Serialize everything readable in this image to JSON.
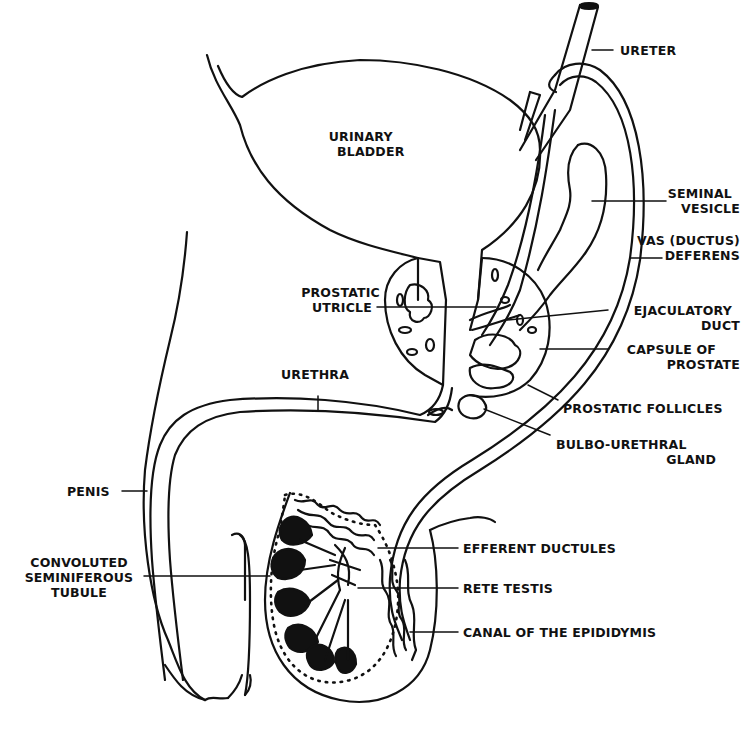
{
  "diagram": {
    "colors": {
      "ink": "#111111",
      "background": "#ffffff"
    },
    "labels": [
      {
        "id": "ureter",
        "lines": [
          "URETER"
        ]
      },
      {
        "id": "urinary-bladder",
        "lines": [
          "URINARY",
          "BLADDER"
        ]
      },
      {
        "id": "seminal-vesicle",
        "lines": [
          "SEMINAL",
          "VESICLE"
        ]
      },
      {
        "id": "vas-deferens",
        "lines": [
          "VAS (DUCTUS)",
          "DEFERENS"
        ]
      },
      {
        "id": "prostatic-utricle",
        "lines": [
          "PROSTATIC",
          "UTRICLE"
        ]
      },
      {
        "id": "ejaculatory-duct",
        "lines": [
          "EJACULATORY",
          "DUCT"
        ]
      },
      {
        "id": "capsule-of-prostate",
        "lines": [
          "CAPSULE OF",
          "PROSTATE"
        ]
      },
      {
        "id": "urethra",
        "lines": [
          "URETHRA"
        ]
      },
      {
        "id": "prostatic-follicles",
        "lines": [
          "PROSTATIC FOLLICLES"
        ]
      },
      {
        "id": "bulbo-urethral-gland",
        "lines": [
          "BULBO-URETHRAL",
          "GLAND"
        ]
      },
      {
        "id": "penis",
        "lines": [
          "PENIS"
        ]
      },
      {
        "id": "efferent-ductules",
        "lines": [
          "EFFERENT DUCTULES"
        ]
      },
      {
        "id": "convoluted-seminiferous-tubule",
        "lines": [
          "CONVOLUTED",
          "SEMINIFEROUS",
          "TUBULE"
        ]
      },
      {
        "id": "rete-testis",
        "lines": [
          "RETE TESTIS"
        ]
      },
      {
        "id": "canal-of-epididymis",
        "lines": [
          "CANAL OF THE EPIDIDYMIS"
        ]
      }
    ]
  }
}
